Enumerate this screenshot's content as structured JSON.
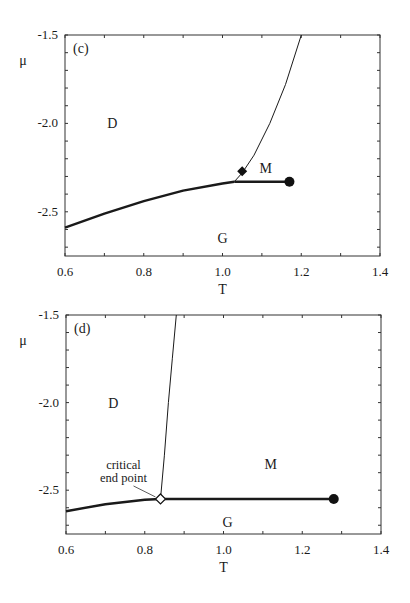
{
  "chart_data": [
    {
      "type": "line",
      "panel_label": "(c)",
      "title": "",
      "xlabel": "T",
      "ylabel": "μ",
      "xlim": [
        0.6,
        1.4
      ],
      "ylim": [
        -2.75,
        -1.5
      ],
      "x_ticks": [
        "0.6",
        "0.8",
        "1.0",
        "1.2",
        "1.4"
      ],
      "y_ticks": [
        "-1.5",
        "-2.0",
        "-2.5"
      ],
      "grid": false,
      "regions": [
        {
          "label": "D",
          "x": 0.72,
          "y": -2.0
        },
        {
          "label": "M",
          "x": 1.11,
          "y": -2.25
        },
        {
          "label": "G",
          "x": 1.0,
          "y": -2.65
        }
      ],
      "series": [
        {
          "name": "D-G coexistence (thick)",
          "x": [
            0.6,
            0.7,
            0.8,
            0.9,
            1.0,
            1.03
          ],
          "y": [
            -2.59,
            -2.51,
            -2.44,
            -2.38,
            -2.34,
            -2.33
          ]
        },
        {
          "name": "M-G coexistence (thick)",
          "x": [
            1.03,
            1.1,
            1.17
          ],
          "y": [
            -2.33,
            -2.33,
            -2.33
          ]
        },
        {
          "name": "D-M transition (thin)",
          "x": [
            1.03,
            1.05,
            1.08,
            1.12,
            1.16,
            1.2
          ],
          "y": [
            -2.33,
            -2.28,
            -2.18,
            -2.0,
            -1.78,
            -1.5
          ]
        }
      ],
      "markers": [
        {
          "type": "filled-diamond",
          "x": 1.05,
          "y": -2.27
        },
        {
          "type": "filled-circle",
          "label": "critical point",
          "x": 1.17,
          "y": -2.33
        }
      ]
    },
    {
      "type": "line",
      "panel_label": "(d)",
      "title": "",
      "xlabel": "T",
      "ylabel": "μ",
      "xlim": [
        0.6,
        1.4
      ],
      "ylim": [
        -2.75,
        -1.5
      ],
      "x_ticks": [
        "0.6",
        "0.8",
        "1.0",
        "1.2",
        "1.4"
      ],
      "y_ticks": [
        "-1.5",
        "-2.0",
        "-2.5"
      ],
      "grid": false,
      "regions": [
        {
          "label": "D",
          "x": 0.72,
          "y": -2.0
        },
        {
          "label": "M",
          "x": 1.12,
          "y": -2.35
        },
        {
          "label": "G",
          "x": 1.01,
          "y": -2.68
        }
      ],
      "annotations": [
        {
          "text": "critical\nend point",
          "points_to": {
            "x": 0.84,
            "y": -2.55
          }
        }
      ],
      "series": [
        {
          "name": "D-G coexistence (thick)",
          "x": [
            0.6,
            0.7,
            0.8,
            0.84
          ],
          "y": [
            -2.62,
            -2.58,
            -2.555,
            -2.55
          ]
        },
        {
          "name": "M-G coexistence (thick)",
          "x": [
            0.84,
            1.0,
            1.2,
            1.28
          ],
          "y": [
            -2.55,
            -2.55,
            -2.55,
            -2.55
          ]
        },
        {
          "name": "D-M transition (thin)",
          "x": [
            0.84,
            0.85,
            0.86,
            0.87,
            0.88
          ],
          "y": [
            -2.55,
            -2.3,
            -2.0,
            -1.75,
            -1.5
          ]
        }
      ],
      "markers": [
        {
          "type": "open-diamond",
          "label": "critical end point",
          "x": 0.84,
          "y": -2.55
        },
        {
          "type": "filled-circle",
          "label": "critical point",
          "x": 1.28,
          "y": -2.55
        }
      ]
    }
  ]
}
